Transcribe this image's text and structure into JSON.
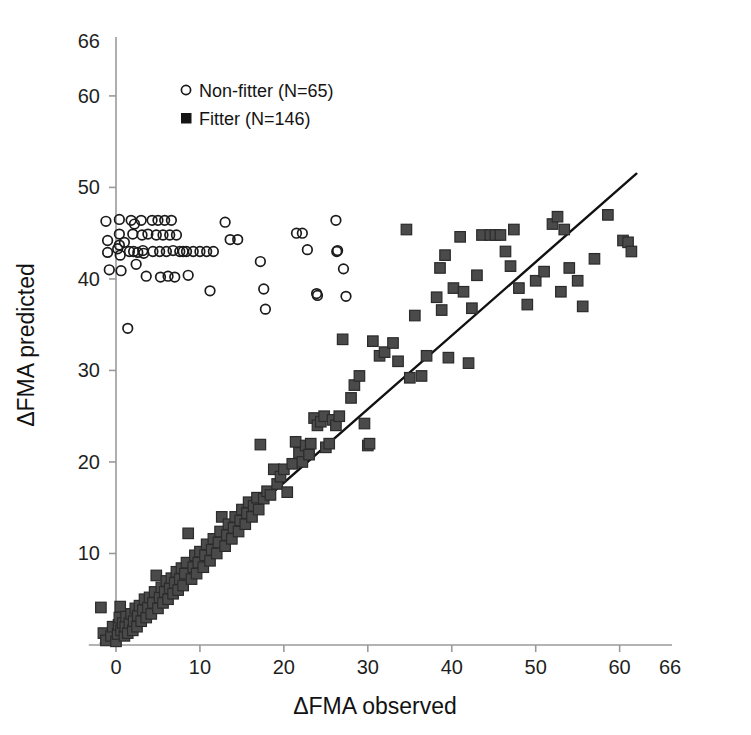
{
  "figure": {
    "background": "#ffffff",
    "line_color": "#111111",
    "axis_color": "#9a9a9a",
    "open_marker_color": "#1b1b1b",
    "filled_marker_color": "#4a4a4a"
  },
  "chart_data": {
    "type": "scatter",
    "title": "",
    "xlabel": "ΔFMA observed",
    "ylabel": "ΔFMA predicted",
    "xlim": [
      -3,
      66
    ],
    "ylim": [
      -1,
      66
    ],
    "xticks": [
      0,
      10,
      20,
      30,
      40,
      50,
      60,
      66
    ],
    "yticks": [
      0,
      10,
      20,
      30,
      40,
      50,
      60,
      66
    ],
    "xticklabels": [
      "0",
      "10",
      "20",
      "30",
      "40",
      "50",
      "60",
      "66"
    ],
    "yticklabels": [
      "0",
      "10",
      "20",
      "30",
      "40",
      "50",
      "60",
      "66"
    ],
    "grid": false,
    "legend_position": "upper-left",
    "legend": [
      {
        "label": "Non-fitter  (N=65)",
        "marker": "open-circle",
        "series": "non_fitter"
      },
      {
        "label": "Fitter (N=146)",
        "marker": "filled-square",
        "series": "fitter"
      }
    ],
    "reference_line": {
      "name": "identity-regression-line",
      "x0": -1.8,
      "y0": 0.2,
      "x1": 62.0,
      "y1": 51.5,
      "color": "#111111"
    },
    "series": [
      {
        "name": "Non-fitter  (N=65)",
        "key": "non_fitter",
        "marker": "open-circle",
        "n": 65,
        "points": [
          [
            -1.2,
            46.3
          ],
          [
            -1.0,
            44.2
          ],
          [
            -1.0,
            42.9
          ],
          [
            -0.8,
            41.0
          ],
          [
            0.4,
            46.5
          ],
          [
            0.4,
            44.9
          ],
          [
            0.4,
            43.7
          ],
          [
            0.5,
            42.6
          ],
          [
            0.6,
            40.9
          ],
          [
            1.4,
            34.6
          ],
          [
            1.6,
            43.0
          ],
          [
            1.8,
            46.4
          ],
          [
            2.0,
            44.9
          ],
          [
            2.1,
            43.0
          ],
          [
            2.4,
            41.6
          ],
          [
            3.0,
            46.4
          ],
          [
            3.1,
            44.8
          ],
          [
            3.2,
            43.1
          ],
          [
            3.3,
            42.8
          ],
          [
            3.6,
            40.3
          ],
          [
            4.3,
            46.4
          ],
          [
            4.4,
            43.0
          ],
          [
            5.0,
            46.4
          ],
          [
            5.2,
            43.0
          ],
          [
            5.3,
            40.2
          ],
          [
            5.8,
            46.4
          ],
          [
            6.0,
            43.0
          ],
          [
            6.2,
            40.3
          ],
          [
            6.6,
            46.4
          ],
          [
            6.8,
            43.1
          ],
          [
            7.0,
            40.2
          ],
          [
            7.6,
            43.0
          ],
          [
            8.4,
            43.0
          ],
          [
            8.6,
            40.4
          ],
          [
            9.2,
            43.0
          ],
          [
            10.0,
            43.0
          ],
          [
            10.8,
            43.0
          ],
          [
            11.2,
            38.7
          ],
          [
            11.6,
            43.0
          ],
          [
            13.0,
            46.2
          ],
          [
            13.6,
            44.3
          ],
          [
            14.5,
            44.3
          ],
          [
            17.2,
            41.9
          ],
          [
            17.6,
            38.9
          ],
          [
            17.8,
            36.7
          ],
          [
            21.5,
            45.0
          ],
          [
            22.2,
            45.0
          ],
          [
            22.8,
            43.2
          ],
          [
            24.0,
            38.2
          ],
          [
            23.9,
            38.4
          ],
          [
            26.2,
            46.4
          ],
          [
            26.4,
            43.1
          ],
          [
            26.3,
            43.0
          ],
          [
            27.1,
            41.1
          ],
          [
            27.4,
            38.1
          ],
          [
            2.2,
            46.0
          ],
          [
            1.0,
            44.0
          ],
          [
            4.8,
            44.8
          ],
          [
            5.6,
            44.8
          ],
          [
            6.4,
            44.8
          ],
          [
            7.2,
            44.8
          ],
          [
            3.8,
            44.9
          ],
          [
            0.2,
            43.3
          ],
          [
            2.6,
            42.9
          ],
          [
            8.0,
            43.0
          ]
        ]
      },
      {
        "name": "Fitter (N=146)",
        "key": "fitter",
        "marker": "filled-square",
        "n": 146,
        "points": [
          [
            -1.8,
            4.1
          ],
          [
            -1.5,
            1.3
          ],
          [
            -1.2,
            0.5
          ],
          [
            -0.6,
            1.0
          ],
          [
            -0.4,
            2.0
          ],
          [
            0.0,
            0.4
          ],
          [
            0.2,
            1.2
          ],
          [
            0.3,
            2.2
          ],
          [
            0.4,
            3.0
          ],
          [
            0.5,
            4.2
          ],
          [
            0.6,
            1.6
          ],
          [
            0.8,
            2.4
          ],
          [
            1.0,
            1.0
          ],
          [
            1.1,
            2.0
          ],
          [
            1.2,
            3.1
          ],
          [
            1.4,
            1.3
          ],
          [
            1.6,
            2.4
          ],
          [
            1.8,
            3.4
          ],
          [
            2.0,
            1.6
          ],
          [
            2.1,
            2.6
          ],
          [
            2.3,
            4.0
          ],
          [
            2.5,
            2.0
          ],
          [
            2.6,
            3.2
          ],
          [
            2.8,
            4.3
          ],
          [
            3.0,
            2.6
          ],
          [
            3.2,
            3.8
          ],
          [
            3.4,
            5.0
          ],
          [
            3.6,
            3.0
          ],
          [
            3.8,
            4.1
          ],
          [
            4.0,
            5.2
          ],
          [
            4.2,
            3.4
          ],
          [
            4.4,
            4.6
          ],
          [
            4.6,
            5.8
          ],
          [
            4.8,
            7.6
          ],
          [
            5.0,
            4.0
          ],
          [
            5.2,
            5.2
          ],
          [
            5.4,
            6.3
          ],
          [
            5.6,
            4.6
          ],
          [
            5.8,
            5.8
          ],
          [
            6.0,
            7.0
          ],
          [
            6.2,
            5.0
          ],
          [
            6.4,
            6.2
          ],
          [
            6.6,
            7.3
          ],
          [
            6.8,
            5.6
          ],
          [
            7.0,
            6.8
          ],
          [
            7.2,
            8.0
          ],
          [
            7.4,
            6.0
          ],
          [
            7.6,
            7.2
          ],
          [
            7.8,
            8.4
          ],
          [
            8.0,
            6.5
          ],
          [
            8.2,
            7.8
          ],
          [
            8.4,
            9.0
          ],
          [
            8.6,
            12.2
          ],
          [
            9.0,
            7.2
          ],
          [
            9.2,
            8.5
          ],
          [
            9.4,
            9.8
          ],
          [
            9.6,
            7.8
          ],
          [
            9.8,
            9.0
          ],
          [
            10.0,
            10.2
          ],
          [
            10.4,
            8.5
          ],
          [
            10.6,
            9.8
          ],
          [
            10.8,
            11.0
          ],
          [
            11.2,
            9.2
          ],
          [
            11.4,
            10.4
          ],
          [
            11.6,
            11.6
          ],
          [
            12.0,
            10.0
          ],
          [
            12.2,
            11.2
          ],
          [
            12.4,
            12.4
          ],
          [
            12.6,
            14.0
          ],
          [
            13.0,
            10.8
          ],
          [
            13.2,
            12.0
          ],
          [
            13.4,
            13.2
          ],
          [
            13.8,
            11.6
          ],
          [
            14.0,
            12.8
          ],
          [
            14.2,
            14.0
          ],
          [
            14.6,
            12.4
          ],
          [
            14.8,
            13.6
          ],
          [
            15.0,
            14.8
          ],
          [
            15.4,
            13.2
          ],
          [
            15.6,
            14.4
          ],
          [
            15.8,
            15.6
          ],
          [
            16.2,
            14.0
          ],
          [
            16.4,
            15.2
          ],
          [
            16.8,
            16.1
          ],
          [
            17.0,
            14.8
          ],
          [
            17.2,
            21.9
          ],
          [
            17.6,
            16.0
          ],
          [
            18.0,
            16.8
          ],
          [
            18.4,
            16.4
          ],
          [
            18.8,
            19.2
          ],
          [
            19.2,
            17.6
          ],
          [
            19.6,
            18.4
          ],
          [
            20.0,
            19.2
          ],
          [
            20.4,
            16.7
          ],
          [
            21.0,
            19.8
          ],
          [
            21.4,
            22.2
          ],
          [
            21.8,
            21.0
          ],
          [
            22.2,
            20.0
          ],
          [
            22.6,
            21.8
          ],
          [
            23.0,
            20.8
          ],
          [
            23.2,
            22.0
          ],
          [
            23.6,
            24.8
          ],
          [
            24.0,
            24.0
          ],
          [
            24.4,
            24.4
          ],
          [
            24.8,
            25.0
          ],
          [
            25.0,
            21.6
          ],
          [
            25.4,
            22.0
          ],
          [
            25.8,
            24.6
          ],
          [
            26.2,
            24.0
          ],
          [
            26.6,
            25.0
          ],
          [
            27.0,
            33.4
          ],
          [
            28.0,
            27.0
          ],
          [
            28.4,
            28.4
          ],
          [
            29.0,
            29.4
          ],
          [
            29.6,
            24.2
          ],
          [
            30.0,
            21.8
          ],
          [
            30.2,
            22.0
          ],
          [
            30.6,
            33.2
          ],
          [
            31.4,
            31.6
          ],
          [
            32.0,
            32.0
          ],
          [
            33.0,
            33.0
          ],
          [
            33.6,
            31.0
          ],
          [
            34.6,
            45.4
          ],
          [
            35.0,
            29.2
          ],
          [
            35.6,
            36.0
          ],
          [
            36.4,
            29.4
          ],
          [
            37.0,
            31.6
          ],
          [
            38.2,
            38.0
          ],
          [
            38.6,
            41.2
          ],
          [
            38.8,
            36.6
          ],
          [
            39.2,
            42.6
          ],
          [
            39.6,
            31.4
          ],
          [
            40.2,
            39.0
          ],
          [
            41.0,
            44.6
          ],
          [
            41.4,
            38.6
          ],
          [
            42.0,
            30.8
          ],
          [
            42.4,
            36.8
          ],
          [
            43.6,
            44.8
          ],
          [
            44.6,
            44.8
          ],
          [
            45.2,
            44.8
          ],
          [
            45.8,
            44.8
          ],
          [
            46.4,
            43.0
          ],
          [
            47.0,
            41.4
          ],
          [
            48.0,
            39.0
          ],
          [
            49.0,
            37.2
          ],
          [
            50.0,
            39.8
          ],
          [
            51.0,
            40.8
          ],
          [
            52.0,
            46.0
          ],
          [
            52.6,
            46.8
          ],
          [
            53.0,
            38.6
          ],
          [
            54.0,
            41.2
          ],
          [
            55.0,
            39.8
          ],
          [
            55.6,
            37.0
          ],
          [
            57.0,
            42.2
          ],
          [
            58.6,
            47.0
          ],
          [
            60.4,
            44.2
          ],
          [
            61.0,
            44.0
          ],
          [
            61.4,
            43.0
          ],
          [
            53.4,
            45.4
          ],
          [
            47.4,
            45.4
          ],
          [
            43.0,
            40.4
          ]
        ]
      }
    ]
  }
}
